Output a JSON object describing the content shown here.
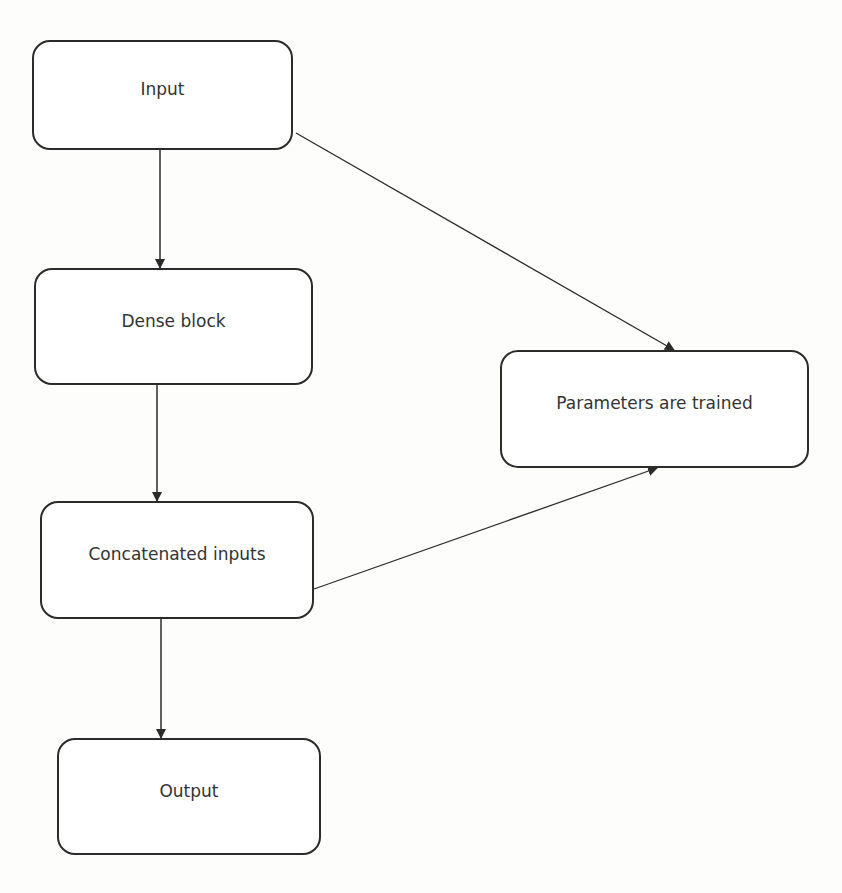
{
  "diagram": {
    "type": "flowchart",
    "colors": {
      "stroke": "#2b2b2b",
      "text": "#333333",
      "background": "#ffffff"
    },
    "nodes": [
      {
        "id": "input",
        "label": "Input"
      },
      {
        "id": "dense",
        "label": "Dense block"
      },
      {
        "id": "concat",
        "label": "Concatenated inputs"
      },
      {
        "id": "output",
        "label": "Output"
      },
      {
        "id": "params",
        "label": "Parameters are trained"
      }
    ],
    "edges": [
      {
        "from": "input",
        "to": "dense"
      },
      {
        "from": "dense",
        "to": "concat"
      },
      {
        "from": "concat",
        "to": "output"
      },
      {
        "from": "input",
        "to": "params"
      },
      {
        "from": "concat",
        "to": "params"
      }
    ]
  }
}
